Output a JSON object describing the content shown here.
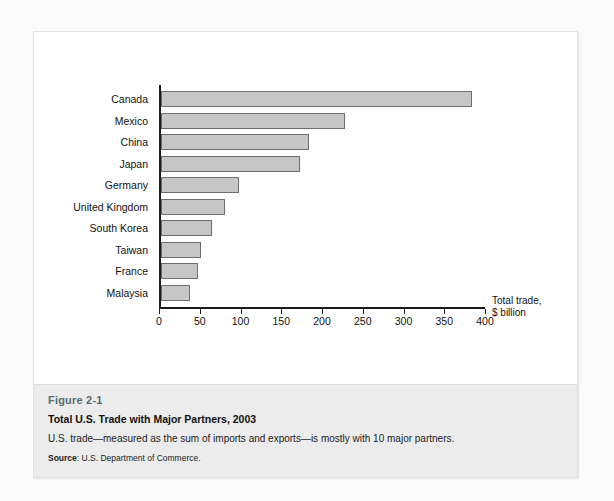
{
  "chart_data": {
    "type": "bar",
    "orientation": "horizontal",
    "title": "Total U.S. Trade with Major Partners, 2003",
    "xlabel": "Total trade, $ billion",
    "ylabel": "",
    "xlim": [
      0,
      400
    ],
    "xticks": [
      0,
      50,
      100,
      150,
      200,
      250,
      300,
      350,
      400
    ],
    "xtick_labels": [
      "0",
      "50",
      "100",
      "150",
      "200",
      "250",
      "300",
      "350",
      "400"
    ],
    "grid": false,
    "legend": false,
    "categories": [
      "Canada",
      "Mexico",
      "China",
      "Japan",
      "Germany",
      "United Kingdom",
      "South Korea",
      "Taiwan",
      "France",
      "Malaysia"
    ],
    "values": [
      382,
      226,
      181,
      170,
      96,
      78,
      62,
      49,
      46,
      36
    ],
    "bar_color": "#c6c6c6",
    "bar_edge_color": "#6e6e6e"
  },
  "axis": {
    "title_line1": "Total trade,",
    "title_line2": "$ billion"
  },
  "caption": {
    "figure_number": "Figure 2-1",
    "title": "Total U.S. Trade with Major Partners, 2003",
    "description": "U.S. trade—measured as the sum of imports and exports—is mostly with 10 major partners.",
    "source_label": "Source",
    "source_text": ": U.S. Department of Commerce."
  },
  "colors": {
    "page_background": "#fbfbfb",
    "figure_background": "#ffffff",
    "caption_background": "#ececec",
    "figure_number_color": "#5a6a74",
    "axis_color": "#1a1a1a"
  }
}
